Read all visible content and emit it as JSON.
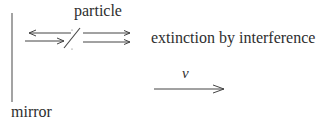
{
  "labels": {
    "particle": "particle",
    "extinction": "extinction by interference",
    "velocity": "v",
    "mirror": "mirror"
  },
  "colors": {
    "line": "#555555",
    "text": "#2e2e2e",
    "background": "#ffffff"
  }
}
